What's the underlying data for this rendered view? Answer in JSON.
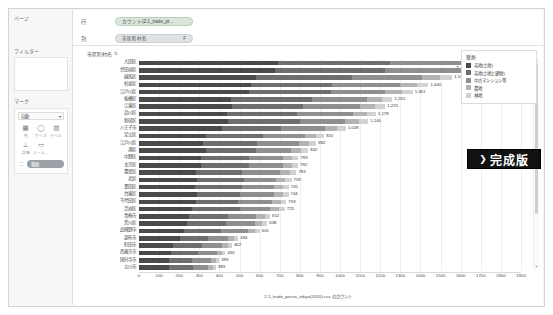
{
  "shelves": {
    "rows_label": "列",
    "cols_label": "行",
    "rows_pill": "カウント(2.1_trade_pr...",
    "cols_pill": "市区町村名",
    "cols_pill_suffix": "F"
  },
  "left_panel": {
    "pages_label": "ページ",
    "filters_label": "フィルター",
    "marks_label": "マーク",
    "mark_type": "自動",
    "chevron": "▾",
    "mark_buttons": [
      {
        "icon": "color-icon",
        "glyph": "▦",
        "caption": "色"
      },
      {
        "icon": "size-icon",
        "glyph": "◯",
        "caption": "サイズ"
      },
      {
        "icon": "label-icon",
        "glyph": "▥",
        "caption": "ラベル"
      },
      {
        "icon": "detail-icon",
        "glyph": "⊥",
        "caption": "詳細"
      },
      {
        "icon": "tooltip-icon",
        "glyph": "▭",
        "caption": "ツール..."
      }
    ],
    "detail_pill": "種類",
    "detail_pill_icon": "⁚⁚"
  },
  "view": {
    "field_header": "市区町村名",
    "sort_icon": "⇅",
    "caption": "2.1_trade_prices_tokyo(2020).csv のカウント ",
    "scroll_up": "▲",
    "scroll_down": "▼"
  },
  "legend": {
    "title": "種類",
    "collapse_icon": "◂",
    "items": [
      {
        "label": "宅地(土地)",
        "color": "#4a4a4a"
      },
      {
        "label": "宅地(土地と建物)",
        "color": "#6e6e6e"
      },
      {
        "label": "中古マンション等",
        "color": "#8f8f8f"
      },
      {
        "label": "農地",
        "color": "#b3b3b3"
      },
      {
        "label": "林地",
        "color": "#d2d2d2"
      }
    ]
  },
  "badge": {
    "chevron": "❯",
    "text": "完成版"
  },
  "chart_data": {
    "type": "bar",
    "orientation": "horizontal",
    "stacked": true,
    "title": "",
    "xlabel": "",
    "ylabel": "市区町村名",
    "xlim": [
      0,
      1900
    ],
    "xticks": [
      0,
      100,
      200,
      300,
      400,
      500,
      600,
      700,
      800,
      900,
      1000,
      1100,
      1200,
      1300,
      1400,
      1500,
      1600,
      1700,
      1800,
      1900
    ],
    "grid": true,
    "legend_position": "right",
    "series": [
      {
        "name": "宅地(土地)",
        "color": "#4a4a4a"
      },
      {
        "name": "宅地(土地と建物)",
        "color": "#6e6e6e"
      },
      {
        "name": "中古マンション等",
        "color": "#8f8f8f"
      },
      {
        "name": "農地",
        "color": "#b3b3b3"
      },
      {
        "name": "林地",
        "color": "#d2d2d2"
      }
    ],
    "categories": [
      "大田区",
      "世田谷区",
      "練馬区",
      "杉並区",
      "江戸川区",
      "板橋区",
      "江東区",
      "品川区",
      "新宿区",
      "八王子市",
      "足立区",
      "江戸川区",
      "港区",
      "中野区",
      "文京区",
      "豊島区",
      "北区",
      "墨田区",
      "台東区",
      "千代田区",
      "渋谷区",
      "青梅市",
      "荒川区",
      "武蔵野市",
      "調布市",
      "町田市",
      "西東京市",
      "国分寺市",
      "立川市"
    ],
    "values": [
      1830,
      1800,
      1558,
      1440,
      1361,
      1261,
      1225,
      1178,
      1140,
      1028,
      920,
      882,
      842,
      793,
      792,
      783,
      759,
      745,
      744,
      733,
      725,
      652,
      638,
      601,
      494,
      462,
      430,
      399,
      383
    ],
    "labels": [
      "1,830",
      "1,800",
      "1,558",
      "1,440",
      "1,361",
      "1,261",
      "1,225",
      "1,178",
      "1,140",
      "1,028",
      "920",
      "882",
      "842",
      "793",
      "792",
      "783",
      "759",
      "745",
      "744",
      "733",
      "725",
      "652",
      "638",
      "601",
      "494",
      "462",
      "430",
      "399",
      "383"
    ]
  }
}
